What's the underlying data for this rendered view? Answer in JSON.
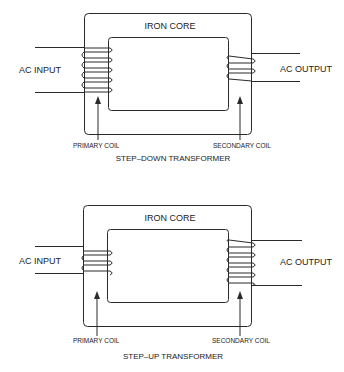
{
  "diagrams": [
    {
      "id": "step-down",
      "title": "STEP–DOWN TRANSFORMER",
      "core_label": "IRON CORE",
      "input_label": "AC INPUT",
      "output_label": "AC OUTPUT",
      "primary_label": "PRIMARY COIL",
      "secondary_label": "SECONDARY COIL",
      "primary_turns": 6,
      "secondary_turns": 3
    },
    {
      "id": "step-up",
      "title": "STEP–UP TRANSFORMER",
      "core_label": "IRON CORE",
      "input_label": "AC INPUT",
      "output_label": "AC OUTPUT",
      "primary_label": "PRIMARY COIL",
      "secondary_label": "SECONDARY COIL",
      "primary_turns": 3,
      "secondary_turns": 6
    }
  ],
  "colors": {
    "line": "#2a2a2a",
    "text": "#222222",
    "background": "#ffffff"
  }
}
